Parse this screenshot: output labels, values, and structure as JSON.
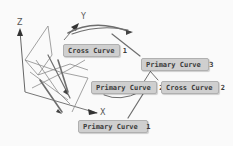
{
  "axes": {
    "x_label": "X",
    "y_label": "Y",
    "z_label": "Z"
  },
  "labels": {
    "cross_curve_1": "Cross Curve  1",
    "cross_curve_2": "Cross Curve  2",
    "primary_curve_1": "Primary Curve  1",
    "primary_curve_2": "Primary Curve  2",
    "primary_curve_3": "Primary Curve  3"
  },
  "colors": {
    "background": "#fafafa",
    "label_fill": "#cfcfcf",
    "curve_stroke": "#6e6e6e",
    "axis_stroke": "#555555"
  }
}
